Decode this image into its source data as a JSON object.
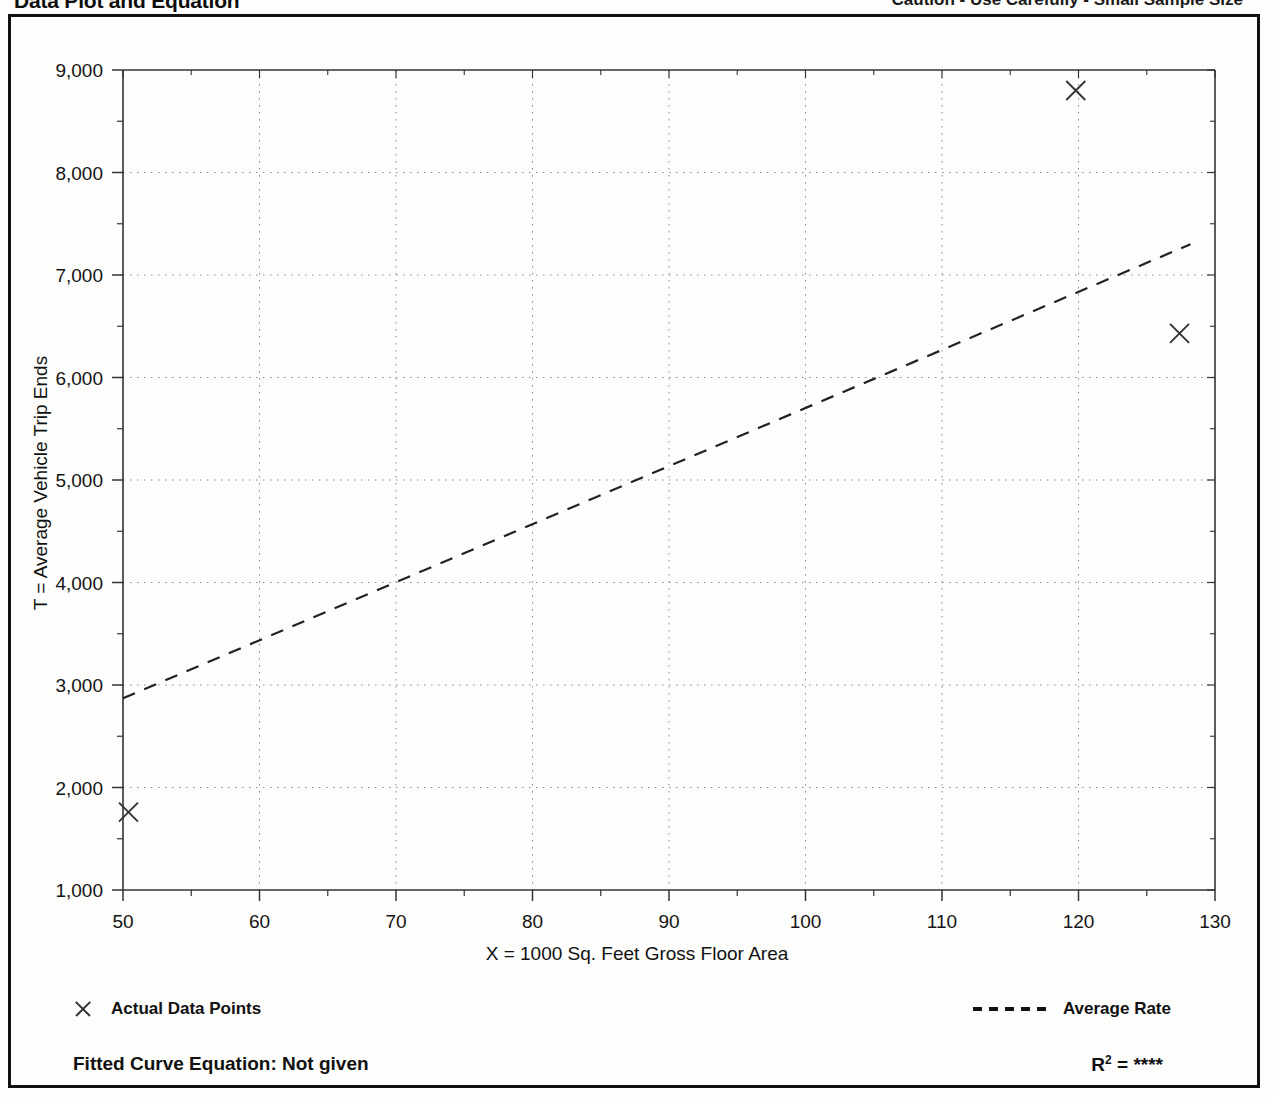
{
  "header": {
    "title": "Data Plot and Equation",
    "caution": "Caution - Use Carefully - Small Sample Size"
  },
  "legend": {
    "data_points_label": "Actual Data Points",
    "average_rate_label": "Average Rate",
    "data_points_marker": "x-marker-icon",
    "average_rate_marker": "dashed-line-icon"
  },
  "footer": {
    "equation_label": "Fitted Curve Equation:  Not given",
    "r_squared_prefix": "R",
    "r_squared_exponent": "2",
    "r_squared_value": "= ****"
  },
  "colors": {
    "frame": "#111111",
    "axis": "#333333",
    "gridline": "#888888",
    "marker": "#333333",
    "trendline": "#222222",
    "background": "#fdfdfb"
  },
  "chart_data": {
    "type": "scatter",
    "title": "Data Plot and Equation",
    "xlabel": "X = 1000 Sq. Feet Gross Floor Area",
    "ylabel": "T = Average Vehicle Trip Ends",
    "xlim": [
      50,
      130
    ],
    "ylim": [
      1000,
      9000
    ],
    "xticks": [
      50,
      60,
      70,
      80,
      90,
      100,
      110,
      120,
      130
    ],
    "xtick_labels": [
      "50",
      "60",
      "70",
      "80",
      "90",
      "100",
      "110",
      "120",
      "130"
    ],
    "yticks": [
      1000,
      2000,
      3000,
      4000,
      5000,
      6000,
      7000,
      8000,
      9000
    ],
    "ytick_labels": [
      "1,000",
      "2,000",
      "3,000",
      "4,000",
      "5,000",
      "6,000",
      "7,000",
      "8,000",
      "9,000"
    ],
    "x_minor_tick_step": 5,
    "y_minor_tick_step": 500,
    "grid": true,
    "grid_style": "dotted",
    "legend_position": "below-axes",
    "series": [
      {
        "name": "Actual Data Points",
        "type": "scatter",
        "marker": "x",
        "points": [
          {
            "x": 50.4,
            "y": 1760
          },
          {
            "x": 119.8,
            "y": 8800
          },
          {
            "x": 127.4,
            "y": 6430
          }
        ]
      },
      {
        "name": "Average Rate",
        "type": "line",
        "style": "dashed",
        "points": [
          {
            "x": 50.0,
            "y": 2870
          },
          {
            "x": 128.2,
            "y": 7300
          }
        ]
      }
    ]
  }
}
